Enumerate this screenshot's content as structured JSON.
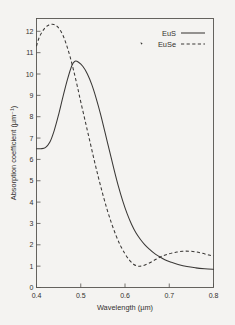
{
  "chart_data": {
    "type": "line",
    "title": "",
    "subtitle": "",
    "xlabel": "Wavelength (µm)",
    "ylabel": "Absorption coefficient (µm⁻¹)",
    "xlim": [
      0.4,
      0.8
    ],
    "ylim": [
      0,
      12.6
    ],
    "xticks": [
      0.4,
      0.5,
      0.6,
      0.7,
      0.8
    ],
    "xticklabels": [
      "0.4",
      "0.5",
      "0.6",
      "0.7",
      "0.8"
    ],
    "yticks": [
      0,
      1,
      2,
      3,
      4,
      5,
      6,
      7,
      8,
      9,
      10,
      11,
      12
    ],
    "yticklabels": [
      "0",
      "1",
      "2",
      "3",
      "4",
      "5",
      "6",
      "7",
      "8",
      "9",
      "10",
      "11",
      "12"
    ],
    "grid": false,
    "legend_position": "top-right-inside",
    "tick_direction": "in",
    "series": [
      {
        "name": "EuS",
        "style": "solid",
        "color": "#3a3836",
        "x": [
          0.4,
          0.41,
          0.42,
          0.43,
          0.44,
          0.45,
          0.46,
          0.47,
          0.48,
          0.487,
          0.495,
          0.505,
          0.515,
          0.525,
          0.535,
          0.545,
          0.555,
          0.565,
          0.575,
          0.585,
          0.595,
          0.605,
          0.615,
          0.625,
          0.635,
          0.645,
          0.655,
          0.665,
          0.675,
          0.69,
          0.705,
          0.72,
          0.74,
          0.76,
          0.78,
          0.8
        ],
        "y": [
          6.5,
          6.5,
          6.55,
          6.8,
          7.35,
          8.1,
          8.95,
          9.75,
          10.4,
          10.6,
          10.55,
          10.35,
          10.0,
          9.5,
          8.85,
          8.1,
          7.25,
          6.4,
          5.55,
          4.75,
          4.05,
          3.45,
          2.95,
          2.55,
          2.25,
          2.0,
          1.8,
          1.62,
          1.48,
          1.3,
          1.18,
          1.08,
          0.98,
          0.92,
          0.88,
          0.85
        ]
      },
      {
        "name": "EuSe",
        "style": "dashed",
        "color": "#3a3836",
        "x": [
          0.4,
          0.405,
          0.412,
          0.42,
          0.428,
          0.436,
          0.444,
          0.452,
          0.46,
          0.468,
          0.476,
          0.484,
          0.492,
          0.5,
          0.51,
          0.52,
          0.53,
          0.54,
          0.55,
          0.56,
          0.57,
          0.58,
          0.59,
          0.6,
          0.61,
          0.62,
          0.63,
          0.64,
          0.655,
          0.67,
          0.685,
          0.7,
          0.715,
          0.73,
          0.745,
          0.76,
          0.775,
          0.79,
          0.8
        ],
        "y": [
          11.3,
          11.65,
          11.95,
          12.18,
          12.3,
          12.33,
          12.28,
          12.1,
          11.8,
          11.35,
          10.8,
          10.15,
          9.45,
          8.7,
          7.8,
          6.9,
          6.0,
          5.15,
          4.35,
          3.62,
          2.98,
          2.42,
          1.95,
          1.58,
          1.28,
          1.08,
          1.0,
          1.02,
          1.15,
          1.32,
          1.48,
          1.58,
          1.65,
          1.7,
          1.7,
          1.67,
          1.6,
          1.52,
          1.48
        ]
      }
    ],
    "annotations": []
  },
  "legend": {
    "entries": [
      {
        "label": "EuS",
        "style": "solid"
      },
      {
        "label": "EuSe",
        "style": "dashed"
      }
    ]
  }
}
